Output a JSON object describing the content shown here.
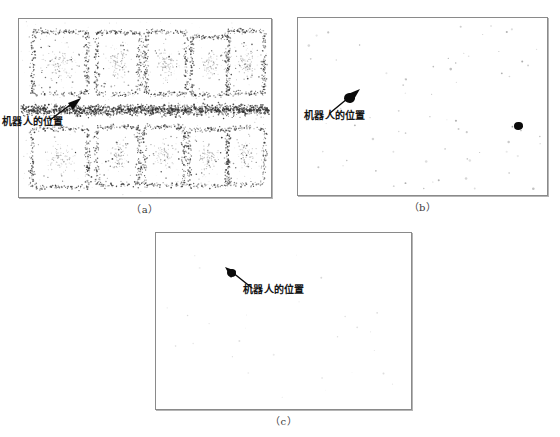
{
  "figure": {
    "panels": [
      {
        "id": "a",
        "caption": "（a）",
        "annotation_label": "机器人的位置",
        "description": "particles-dispersed-over-map"
      },
      {
        "id": "b",
        "caption": "（b）",
        "annotation_label": "机器人的位置",
        "description": "particles-partially-converged"
      },
      {
        "id": "c",
        "caption": "（c）",
        "annotation_label": "机器人的位置",
        "description": "particles-fully-converged"
      }
    ]
  },
  "colors": {
    "background": "#ffffff",
    "panel_border": "#8a8a8a",
    "particle": "#333333",
    "robot_marker": "#0b0b0b",
    "annotation_text": "#151515",
    "caption_text": "#3a3a3a"
  },
  "chart_data": {
    "type": "scatter",
    "title": "",
    "xlabel": "",
    "ylabel": "",
    "grid": false,
    "legend_position": "none",
    "xlim": [
      0,
      254
    ],
    "ylim": [
      0,
      180
    ],
    "panels": [
      {
        "name": "a",
        "caption": "（a）",
        "particle_count_estimate": 4200,
        "annotation": {
          "text": "机器人的位置",
          "target_x": 62,
          "target_y": 82
        },
        "clusters": [
          {
            "name": "room-top-1",
            "cx": 42,
            "cy": 45,
            "shape": "ring",
            "w": 54,
            "h": 62,
            "n": 330
          },
          {
            "name": "room-top-2",
            "cx": 100,
            "cy": 45,
            "shape": "ring",
            "w": 42,
            "h": 62,
            "n": 280
          },
          {
            "name": "room-top-3",
            "cx": 148,
            "cy": 45,
            "shape": "ring",
            "w": 40,
            "h": 62,
            "n": 270
          },
          {
            "name": "room-top-4",
            "cx": 192,
            "cy": 48,
            "shape": "ring",
            "w": 36,
            "h": 58,
            "n": 240
          },
          {
            "name": "room-top-5",
            "cx": 228,
            "cy": 44,
            "shape": "ring",
            "w": 36,
            "h": 62,
            "n": 300
          },
          {
            "name": "corridor",
            "cx": 127,
            "cy": 92,
            "shape": "band",
            "w": 248,
            "h": 20,
            "n": 1500
          },
          {
            "name": "room-bot-1",
            "cx": 42,
            "cy": 140,
            "shape": "ring",
            "w": 56,
            "h": 58,
            "n": 300
          },
          {
            "name": "room-bot-2",
            "cx": 100,
            "cy": 138,
            "shape": "ring",
            "w": 42,
            "h": 58,
            "n": 270
          },
          {
            "name": "room-bot-3",
            "cx": 146,
            "cy": 138,
            "shape": "ring",
            "w": 40,
            "h": 58,
            "n": 260
          },
          {
            "name": "room-bot-4",
            "cx": 190,
            "cy": 140,
            "shape": "ring",
            "w": 38,
            "h": 56,
            "n": 250
          },
          {
            "name": "room-bot-5",
            "cx": 228,
            "cy": 138,
            "shape": "ring",
            "w": 36,
            "h": 56,
            "n": 230
          }
        ]
      },
      {
        "name": "b",
        "caption": "（b）",
        "particle_count_estimate": 60,
        "annotation": {
          "text": "机器人的位置",
          "target_x": 52,
          "target_y": 80
        },
        "dense_markers": [
          {
            "x": 52,
            "y": 80,
            "r": 5.5
          },
          {
            "x": 220,
            "y": 109,
            "r": 4.5
          }
        ]
      },
      {
        "name": "c",
        "caption": "（c）",
        "particle_count_estimate": 1,
        "annotation": {
          "text": "机器人的位置",
          "target_x": 76,
          "target_y": 41
        },
        "dense_markers": [
          {
            "x": 76,
            "y": 41,
            "r": 4.5
          }
        ]
      }
    ]
  }
}
